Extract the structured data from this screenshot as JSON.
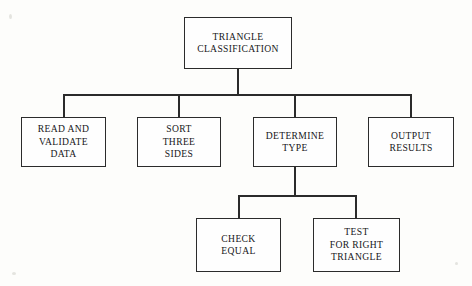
{
  "diagram": {
    "type": "hierarchy-tree",
    "colors": {
      "background": "#fdfdfb",
      "box_fill": "#fefefe",
      "line": "#2b2b2b",
      "text": "#17171a"
    },
    "levels": [
      {
        "level": 1,
        "nodes": [
          {
            "id": "root",
            "label": "TRIANGLE\nCLASSIFICATION"
          }
        ]
      },
      {
        "level": 2,
        "nodes": [
          {
            "id": "read-validate",
            "label": "READ AND\nVALIDATE\nDATA"
          },
          {
            "id": "sort-sides",
            "label": "SORT\nTHREE\nSIDES"
          },
          {
            "id": "determine-type",
            "label": "DETERMINE\nTYPE"
          },
          {
            "id": "output-results",
            "label": "OUTPUT\nRESULTS"
          }
        ]
      },
      {
        "level": 3,
        "nodes": [
          {
            "id": "check-equal",
            "label": "CHECK\nEQUAL"
          },
          {
            "id": "test-right",
            "label": "TEST\nFOR RIGHT\nTRIANGLE"
          }
        ]
      }
    ],
    "edges": [
      {
        "from": "root",
        "to": "read-validate"
      },
      {
        "from": "root",
        "to": "sort-sides"
      },
      {
        "from": "root",
        "to": "determine-type"
      },
      {
        "from": "root",
        "to": "output-results"
      },
      {
        "from": "determine-type",
        "to": "check-equal"
      },
      {
        "from": "determine-type",
        "to": "test-right"
      }
    ]
  }
}
